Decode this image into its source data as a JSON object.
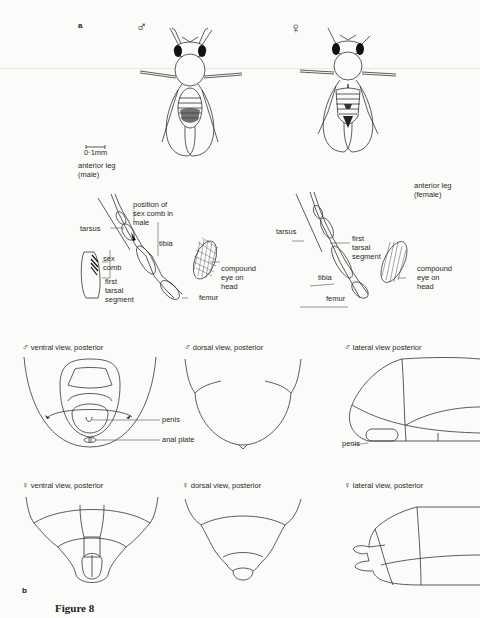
{
  "figure": {
    "caption": "Figure 8",
    "panel_a": {
      "letter": "a",
      "male_symbol": "♂",
      "female_symbol": "♀",
      "scale_bar": "0·1mm",
      "male_leg_title": [
        "anterior leg",
        "(male)"
      ],
      "female_leg_title": [
        "anterior leg",
        "(female)"
      ],
      "male_leg_labels": {
        "tarsus": "tarsus",
        "sex_comb_position": [
          "position of",
          "sex comb in",
          "male"
        ],
        "tibia": "tibia",
        "sex_comb": [
          "sex",
          "comb"
        ],
        "first_tarsal": [
          "first",
          "tarsal",
          "segment"
        ],
        "compound_eye": [
          "compound",
          "eye on",
          "head"
        ],
        "femur": "femur"
      },
      "female_leg_labels": {
        "tarsus": "tarsus",
        "first_tarsal": [
          "first",
          "tarsal",
          "segment"
        ],
        "tibia": "tibia",
        "compound_eye": [
          "compound",
          "eye on",
          "head"
        ],
        "femur": "femur"
      }
    },
    "panel_b": {
      "letter": "b",
      "male_views": [
        {
          "symbol": "♂",
          "title": "ventral view, posterior"
        },
        {
          "symbol": "♂",
          "title": "dorsal view, posterior"
        },
        {
          "symbol": "♂",
          "title": "lateral view posterior"
        }
      ],
      "female_views": [
        {
          "symbol": "♀",
          "title": "ventral view, posterior"
        },
        {
          "symbol": "♀",
          "title": "dorsal view, posterior"
        },
        {
          "symbol": "♀",
          "title": "lateral view, posterior"
        }
      ],
      "male_labels": {
        "penis": "penis",
        "anal_plate": "anal  plate",
        "lateral_penis": "penis"
      }
    }
  }
}
